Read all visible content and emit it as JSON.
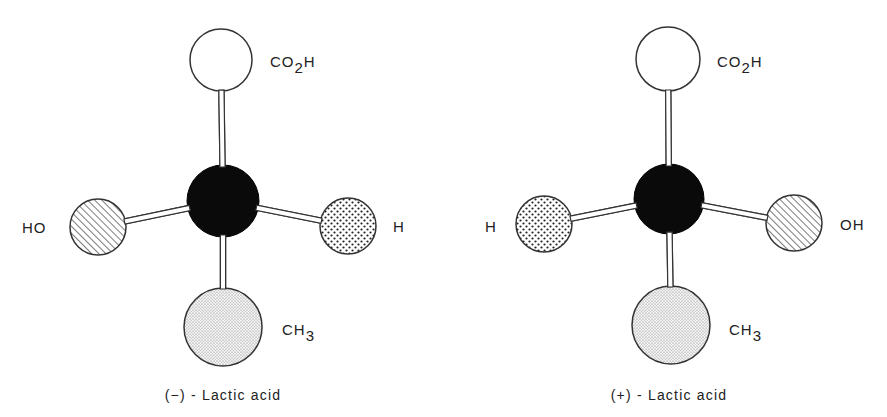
{
  "diagram": {
    "type": "ball-and-stick stereoisomers",
    "molecules": [
      {
        "caption": "(−) - Lactic acid",
        "center_atom": {
          "x": 223,
          "y": 201,
          "r": 36,
          "fill": "black"
        },
        "groups": [
          {
            "name": "CO2H",
            "main": "CO",
            "sub": "2",
            "tail": "H",
            "x": 221,
            "y": 60,
            "r": 31,
            "pattern": "none",
            "label_x": 270,
            "label_y": 67
          },
          {
            "name": "HO",
            "main": "HO",
            "sub": "",
            "tail": "",
            "x": 98,
            "y": 227,
            "r": 28,
            "pattern": "hatch",
            "label_x": 22,
            "label_y": 233
          },
          {
            "name": "H",
            "main": "H",
            "sub": "",
            "tail": "",
            "x": 348,
            "y": 226,
            "r": 28,
            "pattern": "dots",
            "label_x": 393,
            "label_y": 232
          },
          {
            "name": "CH3",
            "main": "CH",
            "sub": "3",
            "tail": "",
            "x": 223,
            "y": 327,
            "r": 39,
            "pattern": "stipple",
            "label_x": 282,
            "label_y": 335
          }
        ]
      },
      {
        "caption": "(+) - Lactic acid",
        "center_atom": {
          "x": 669,
          "y": 199,
          "r": 35,
          "fill": "black"
        },
        "groups": [
          {
            "name": "CO2H",
            "main": "CO",
            "sub": "2",
            "tail": "H",
            "x": 668,
            "y": 59,
            "r": 32,
            "pattern": "none",
            "label_x": 717,
            "label_y": 67
          },
          {
            "name": "H",
            "main": "H",
            "sub": "",
            "tail": "",
            "x": 544,
            "y": 224,
            "r": 28,
            "pattern": "dots",
            "label_x": 485,
            "label_y": 232
          },
          {
            "name": "OH",
            "main": "OH",
            "sub": "",
            "tail": "",
            "x": 794,
            "y": 223,
            "r": 28,
            "pattern": "hatch",
            "label_x": 840,
            "label_y": 230
          },
          {
            "name": "CH3",
            "main": "CH",
            "sub": "3",
            "tail": "",
            "x": 671,
            "y": 325,
            "r": 39,
            "pattern": "stipple",
            "label_x": 729,
            "label_y": 335
          }
        ]
      }
    ],
    "caption_y": 400,
    "colors": {
      "stroke": "#333333",
      "atom": "#0a0a0a",
      "background": "#ffffff"
    }
  }
}
